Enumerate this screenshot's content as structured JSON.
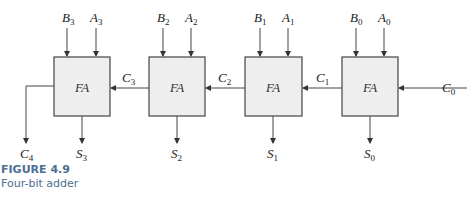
{
  "figure": {
    "label": "FIGURE 4.9",
    "caption": "Four-bit adder"
  },
  "blocks": [
    {
      "label": "FA",
      "inputs": [
        "B3",
        "A3"
      ],
      "sum": "S3",
      "carry_out": "C4"
    },
    {
      "label": "FA",
      "inputs": [
        "B2",
        "A2"
      ],
      "sum": "S2",
      "carry_out": "C3"
    },
    {
      "label": "FA",
      "inputs": [
        "B1",
        "A1"
      ],
      "sum": "S1",
      "carry_out": "C2"
    },
    {
      "label": "FA",
      "inputs": [
        "B0",
        "A0"
      ],
      "sum": "S0",
      "carry_out": "C1"
    }
  ],
  "carry_in": "C0",
  "colors": {
    "block_fill": "#eeeeee",
    "stroke": "#444444",
    "caption": "#4a6f93"
  }
}
